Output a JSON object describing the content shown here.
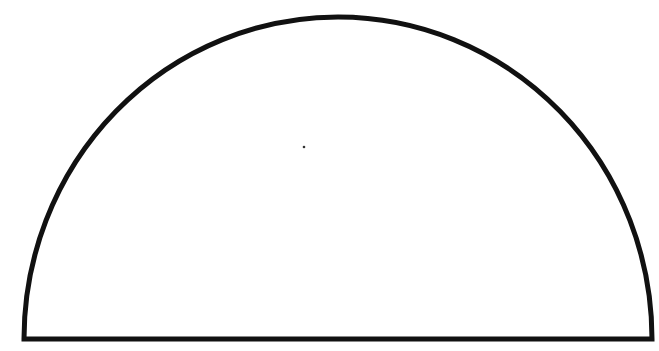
{
  "diagram": {
    "shape": "semicircle",
    "stroke_color": "#111111",
    "fill_color": "#ffffff",
    "background": "#ffffff",
    "stroke_width": 5,
    "base": {
      "x1": 24,
      "y1": 339,
      "x2": 652,
      "y2": 339
    },
    "arc": {
      "rx": 314,
      "ry": 322
    },
    "center_dot": {
      "cx": 304,
      "cy": 147,
      "r": 1.3
    }
  }
}
